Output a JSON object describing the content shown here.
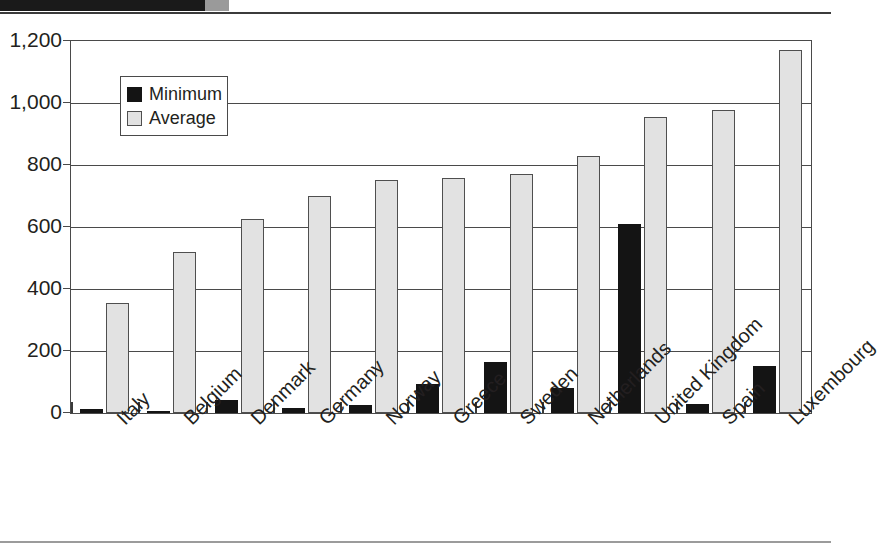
{
  "chart_data": {
    "type": "bar",
    "title": "",
    "xlabel": "",
    "ylabel": "",
    "ylim": [
      0,
      1200
    ],
    "grid": true,
    "legend_position": "top-left-inside",
    "categories": [
      "Italy",
      "Belgium",
      "Denmark",
      "Germany",
      "Norway",
      "Greece",
      "Sweden",
      "Netherlands",
      "United Kingdom",
      "Spain",
      "Luxembourg"
    ],
    "series": [
      {
        "name": "Minimum",
        "color": "#141414",
        "values": [
          12,
          8,
          42,
          15,
          25,
          95,
          165,
          80,
          610,
          30,
          152
        ]
      },
      {
        "name": "Average",
        "color": "#e2e2e2",
        "values": [
          355,
          520,
          625,
          700,
          753,
          757,
          770,
          828,
          955,
          978,
          1170
        ]
      }
    ],
    "yticks": [
      0,
      200,
      400,
      600,
      800,
      1000,
      1200
    ],
    "ytick_labels": [
      "0",
      "200",
      "400",
      "600",
      "800",
      "1,000",
      "1,200"
    ]
  },
  "legend": {
    "items": [
      {
        "label": "Minimum",
        "swatch": "minimum"
      },
      {
        "label": "Average",
        "swatch": "average"
      }
    ]
  },
  "colors": {
    "minimum": "#141414",
    "average": "#e2e2e2",
    "axis": "#4a4a4a",
    "text": "#231f20",
    "header_bar": "#1a1a1a"
  }
}
